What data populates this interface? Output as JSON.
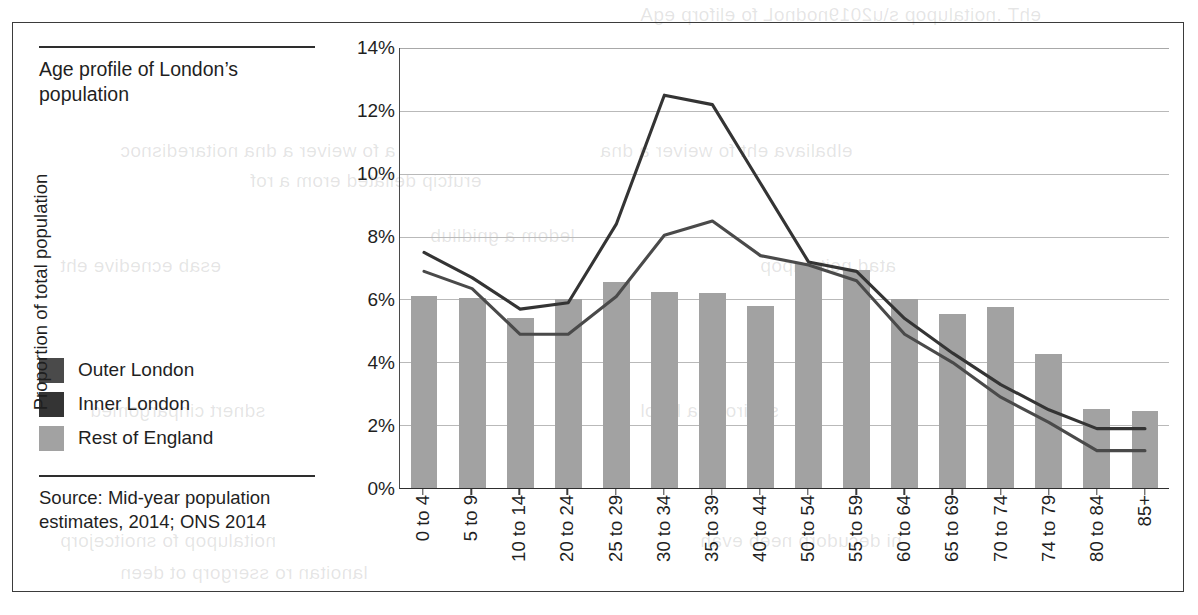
{
  "figure": {
    "title": "Age profile of London’s population",
    "source": "Source: Mid-year population estimates, 2014; ONS 2014"
  },
  "legend": {
    "position": "left-panel",
    "items": [
      {
        "label": "Outer London",
        "color": "#4a4a4a"
      },
      {
        "label": "Inner London",
        "color": "#343434"
      },
      {
        "label": "Rest of England",
        "color": "#a2a2a2"
      }
    ]
  },
  "axes": {
    "ylabel": "Proportion of total population",
    "yticks": [
      "0%",
      "2%",
      "4%",
      "6%",
      "8%",
      "10%",
      "12%",
      "14%"
    ]
  },
  "chart_data": {
    "type": "bar",
    "title": "Age profile of London’s population",
    "subtitle": "",
    "xlabel": "",
    "ylabel": "Proportion of total population",
    "ylim": [
      0,
      14
    ],
    "ytick_values": [
      0,
      2,
      4,
      6,
      8,
      10,
      12,
      14
    ],
    "ytick_labels": [
      "0%",
      "2%",
      "4%",
      "6%",
      "8%",
      "10%",
      "12%",
      "14%"
    ],
    "grid": "horizontal",
    "legend_position": "left",
    "units": "percent",
    "categories": [
      "0 to 4",
      "5 to 9",
      "10 to 14",
      "20 to 24",
      "25 to 29",
      "30 to 34",
      "35 to 39",
      "40 to 44",
      "50 to 54",
      "55 to 59",
      "60 to 64",
      "65 to 69",
      "70 to 74",
      "74 to 79",
      "80 to 84",
      "85+"
    ],
    "series": [
      {
        "name": "Rest of England",
        "render": "bar",
        "color": "#a2a2a2",
        "values": [
          6.1,
          6.05,
          5.4,
          6.0,
          6.55,
          6.25,
          6.2,
          5.8,
          7.15,
          6.95,
          6.0,
          5.55,
          5.75,
          4.25,
          2.5,
          2.45
        ]
      },
      {
        "name": "Inner London",
        "render": "line",
        "color": "#343434",
        "values": [
          7.5,
          6.7,
          5.7,
          5.9,
          8.4,
          12.5,
          12.2,
          9.7,
          7.2,
          6.9,
          5.4,
          4.3,
          3.3,
          2.5,
          1.9,
          1.9
        ]
      },
      {
        "name": "Outer London",
        "render": "line",
        "color": "#4a4a4a",
        "values": [
          6.9,
          6.35,
          4.9,
          4.9,
          6.1,
          8.05,
          8.5,
          7.4,
          7.1,
          6.6,
          4.9,
          4.0,
          2.9,
          2.1,
          1.2,
          1.2
        ]
      }
    ]
  },
  "bleed_text": [
    "Age profile of London’s population",
    "consideration and a review of the available",
    "information for a more detailed picture",
    "building a model",
    "the evidence base",
    "population data"
  ]
}
